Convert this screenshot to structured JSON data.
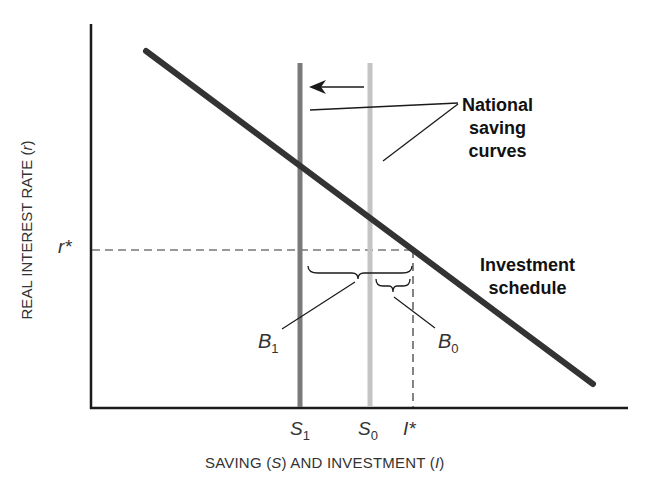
{
  "diagram": {
    "type": "economics-supply-demand",
    "axes": {
      "y_label_prefix": "REAL INTEREST RATE (",
      "y_label_var": "r",
      "y_label_suffix": ")",
      "x_label_prefix": "SAVING (",
      "x_label_var1": "S",
      "x_label_mid": ") AND INVESTMENT (",
      "x_label_var2": "I",
      "x_label_suffix": ")"
    },
    "ticks": {
      "r_star": "r*",
      "s1_base": "S",
      "s1_sub": "1",
      "s0_base": "S",
      "s0_sub": "0",
      "i_star": "I*"
    },
    "curves": {
      "investment_schedule": {
        "label_line1": "Investment",
        "label_line2": "schedule",
        "color": "#333333"
      },
      "saving_s1": {
        "color": "#7a7a7a"
      },
      "saving_s0": {
        "color": "#c4c4c4"
      }
    },
    "callouts": {
      "national_saving_line1": "National",
      "national_saving_line2": "saving",
      "national_saving_line3": "curves",
      "b1_base": "B",
      "b1_sub": "1",
      "b0_base": "B",
      "b0_sub": "0"
    },
    "shift_arrow": {
      "direction": "left"
    }
  }
}
